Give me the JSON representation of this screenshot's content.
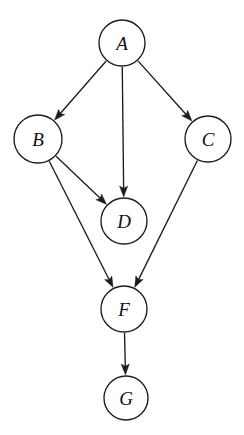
{
  "diagram": {
    "type": "directed-graph",
    "background_color": "#ffffff",
    "stroke_color": "#1c1c1c",
    "node_fill_color": "#ffffff",
    "label_color": "#111111"
  },
  "nodes": [
    {
      "id": "A",
      "label": "A",
      "cx": 122,
      "cy": 43,
      "r": 23
    },
    {
      "id": "B",
      "label": "B",
      "cx": 38,
      "cy": 139,
      "r": 24
    },
    {
      "id": "C",
      "label": "C",
      "cx": 208,
      "cy": 139,
      "r": 23
    },
    {
      "id": "D",
      "label": "D",
      "cx": 124,
      "cy": 221,
      "r": 23
    },
    {
      "id": "F",
      "label": "F",
      "cx": 124,
      "cy": 309,
      "r": 23
    },
    {
      "id": "G",
      "label": "G",
      "cx": 126,
      "cy": 398,
      "r": 22
    }
  ],
  "edges": [
    {
      "id": "A-B",
      "from": "A",
      "to": "B",
      "directed": true
    },
    {
      "id": "A-D",
      "from": "A",
      "to": "D",
      "directed": true
    },
    {
      "id": "A-C",
      "from": "A",
      "to": "C",
      "directed": true
    },
    {
      "id": "B-D",
      "from": "B",
      "to": "D",
      "directed": true
    },
    {
      "id": "B-F",
      "from": "B",
      "to": "F",
      "directed": true
    },
    {
      "id": "C-F",
      "from": "C",
      "to": "F",
      "directed": true
    },
    {
      "id": "F-G",
      "from": "F",
      "to": "G",
      "directed": true
    }
  ]
}
